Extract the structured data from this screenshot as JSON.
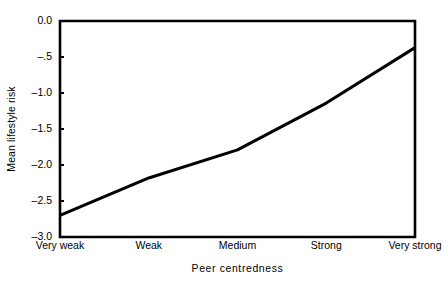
{
  "chart_data": {
    "type": "line",
    "title": "",
    "subtitle": "",
    "xlabel": "Peer centredness",
    "ylabel": "Mean lifestyle risk",
    "categories": [
      "Very weak",
      "Weak",
      "Medium",
      "Strong",
      "Very strong"
    ],
    "values": [
      -2.7,
      -2.18,
      -1.79,
      -1.14,
      -0.37
    ],
    "series": [
      {
        "name": "Mean lifestyle risk",
        "values": [
          -2.7,
          -2.18,
          -1.79,
          -1.14,
          -0.37
        ]
      }
    ],
    "ylim": [
      -3.0,
      0.0
    ],
    "ytick_values": [
      0.0,
      -0.5,
      -1.0,
      -1.5,
      -2.0,
      -2.5,
      -3.0
    ],
    "ytick_labels": [
      "0.0",
      "–.5",
      "–1.0",
      "–1.5",
      "–2.0",
      "–2.5",
      "–3.0"
    ],
    "xtick_labels": [
      "Very weak",
      "Weak",
      "Medium",
      "Strong",
      "Very strong"
    ],
    "grid": false,
    "legend": false,
    "legend_position": "none",
    "line_color": "#000000",
    "line_width": 3,
    "axis_color": "#000000",
    "background_color": "#ffffff",
    "annotations": []
  }
}
